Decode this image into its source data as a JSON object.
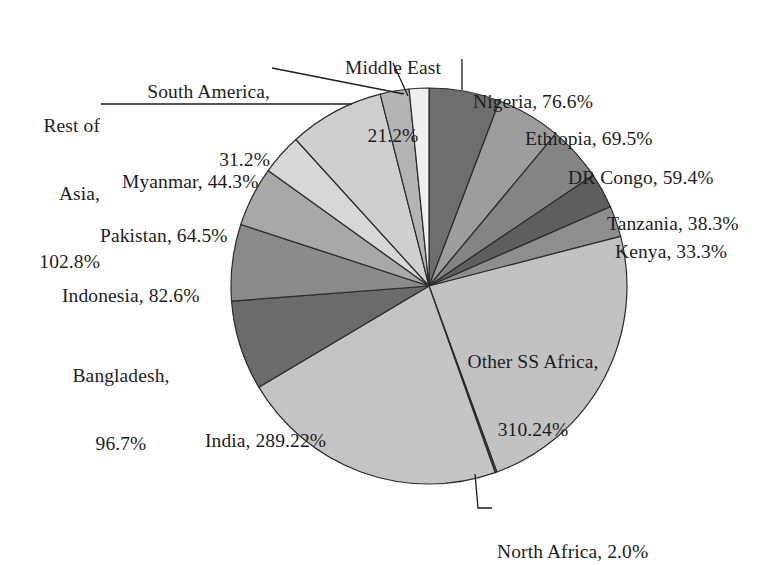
{
  "chart_data": {
    "type": "pie",
    "title": "",
    "subtitle": "",
    "xlabel": "",
    "ylabel": "",
    "legend_position": "none",
    "grid": false,
    "value_unit": "%",
    "total": 1442.04,
    "start_angle_deg": 0,
    "direction": "clockwise",
    "categories": [
      "Nigeria",
      "Ethiopia",
      "DR Congo",
      "Tanzania",
      "Kenya",
      "Other SS Africa",
      "North Africa",
      "India",
      "Bangladesh",
      "Indonesia",
      "Pakistan",
      "Myanmar",
      "Rest of Asia",
      "South America",
      "Middle East"
    ],
    "values": [
      76.6,
      69.5,
      59.4,
      38.3,
      33.3,
      310.24,
      2.0,
      289.22,
      96.7,
      82.6,
      64.5,
      44.3,
      102.8,
      31.2,
      21.2
    ],
    "value_texts": [
      "76.6%",
      "69.5%",
      "59.4%",
      "38.3%",
      "33.3%",
      "310.24%",
      "2.0%",
      "289.22%",
      "96.7%",
      "82.6%",
      "64.5%",
      "44.3%",
      "102.8%",
      "31.2%",
      "21.2%"
    ],
    "slice_colors": [
      "#6e6e6e",
      "#9d9d9d",
      "#848484",
      "#5e5e5e",
      "#8e8e8e",
      "#c2c2c2",
      "#4a4a4a",
      "#c4c4c4",
      "#6b6b6b",
      "#8b8b8b",
      "#a8a8a8",
      "#d7d7d7",
      "#cfcfcf",
      "#b4b4b4",
      "#efefef"
    ],
    "slice_stroke": "#2b2b2b"
  },
  "labels": [
    {
      "id": "middle-east",
      "line1": "Middle East",
      "line2": "21.2%"
    },
    {
      "id": "south-america",
      "line1": "South America,",
      "line2": "31.2%"
    },
    {
      "id": "rest-of-asia",
      "line1": "Rest of",
      "line2": "Asia,",
      "line3": "102.8%"
    },
    {
      "id": "myanmar",
      "line1": "Myanmar, 44.3%",
      "line2": ""
    },
    {
      "id": "pakistan",
      "line1": "Pakistan, 64.5%",
      "line2": ""
    },
    {
      "id": "indonesia",
      "line1": "Indonesia, 82.6%",
      "line2": ""
    },
    {
      "id": "bangladesh",
      "line1": "Bangladesh,",
      "line2": "96.7%"
    },
    {
      "id": "india",
      "line1": "India, 289.22%",
      "line2": ""
    },
    {
      "id": "north-africa",
      "line1": "North Africa, 2.0%",
      "line2": ""
    },
    {
      "id": "other-ss-africa",
      "line1": "Other SS Africa,",
      "line2": "310.24%"
    },
    {
      "id": "kenya",
      "line1": "Kenya, 33.3%",
      "line2": ""
    },
    {
      "id": "tanzania",
      "line1": "Tanzania, 38.3%",
      "line2": ""
    },
    {
      "id": "dr-congo",
      "line1": "DR Congo, 59.4%",
      "line2": ""
    },
    {
      "id": "ethiopia",
      "line1": "Ethiopia, 69.5%",
      "line2": ""
    },
    {
      "id": "nigeria",
      "line1": "Nigeria, 76.6%",
      "line2": ""
    }
  ]
}
